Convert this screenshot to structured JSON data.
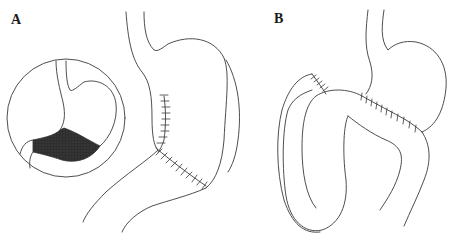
{
  "figure": {
    "panels": [
      {
        "id": "A",
        "label": "A"
      },
      {
        "id": "B",
        "label": "B"
      }
    ],
    "colors": {
      "line": "#3a3a3a",
      "shaded_region": "#2e2e2e",
      "background": "#ffffff"
    }
  }
}
